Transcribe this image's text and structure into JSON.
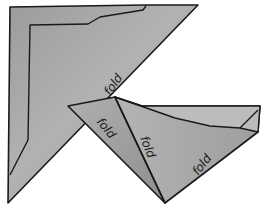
{
  "illustration": {
    "subject": "folded-triangle-diagram",
    "colors": {
      "paper": "#a9a9a9",
      "paper_dark": "#8f8f8f",
      "paper_light": "#bdbdbd",
      "outline": "#1a1a1a",
      "background": "#ffffff"
    },
    "labels": [
      {
        "text": "fold"
      },
      {
        "text": "fold"
      },
      {
        "text": "fold"
      },
      {
        "text": "fold"
      }
    ]
  }
}
